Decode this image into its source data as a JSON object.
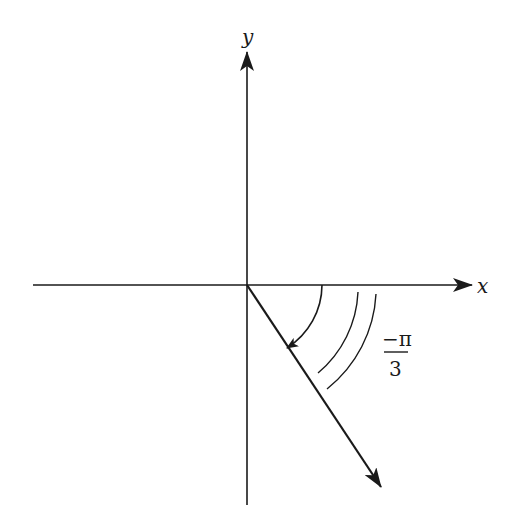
{
  "figure": {
    "type": "angle-diagram",
    "axes": {
      "x_label": "x",
      "y_label": "y"
    },
    "angle": {
      "numerator": "−π",
      "denominator": "3",
      "value_text": "−π/3",
      "direction": "clockwise"
    },
    "colors": {
      "stroke": "#1a1a1a",
      "background": "#ffffff"
    }
  }
}
